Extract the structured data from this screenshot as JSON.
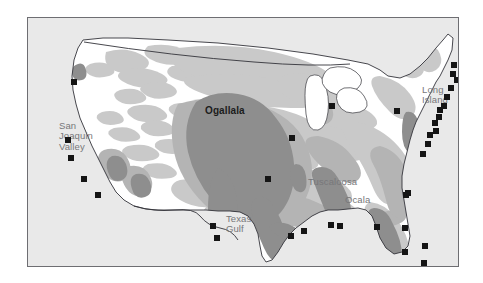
{
  "figure": {
    "kind": "thematic-map",
    "region": "United States",
    "background_color": "#ffffff",
    "frame": {
      "x": 27,
      "y": 17,
      "width": 432,
      "height": 250,
      "border_color": "#6e6e72",
      "fill_color": "#e9e9e9"
    }
  },
  "legend_colors": {
    "land_fill": "#ffffff",
    "light_shading": "#c9c9c9",
    "medium_shading": "#b4b4b4",
    "dark_shading": "#8e8e8e",
    "outline": "#33333a",
    "marker": "#151515",
    "label_gray": "#77777a",
    "label_dark": "#1c1c1c"
  },
  "labels": [
    {
      "id": "san-joaquin-valley",
      "text": "San\nJoaquin\nValley",
      "x": 58,
      "y": 120,
      "style": "gray"
    },
    {
      "id": "ogallala",
      "text": "Ogallala",
      "x": 204,
      "y": 105,
      "style": "dark"
    },
    {
      "id": "tuscaloosa",
      "text": "Tuscaloosa",
      "x": 307,
      "y": 176,
      "style": "gray"
    },
    {
      "id": "ocala",
      "text": "Ocala",
      "x": 344,
      "y": 194,
      "style": "gray"
    },
    {
      "id": "texas-gulf",
      "text": "Texas\nGulf",
      "x": 225,
      "y": 213,
      "style": "gray"
    },
    {
      "id": "long-island",
      "text": "Long\nIsland",
      "x": 421,
      "y": 84,
      "style": "gray"
    }
  ],
  "markers": [
    {
      "id": "marker-pacific-nw",
      "x": 46,
      "y": 64
    },
    {
      "id": "marker-san-joaquin-n",
      "x": 40,
      "y": 122
    },
    {
      "id": "marker-san-joaquin-s",
      "x": 43,
      "y": 140
    },
    {
      "id": "marker-central-coast",
      "x": 56,
      "y": 161
    },
    {
      "id": "marker-socal",
      "x": 70,
      "y": 177
    },
    {
      "id": "marker-west-tx-n",
      "x": 185,
      "y": 208
    },
    {
      "id": "marker-west-tx-s",
      "x": 189,
      "y": 220
    },
    {
      "id": "marker-ogallala-e",
      "x": 264,
      "y": 120
    },
    {
      "id": "marker-central-plains",
      "x": 240,
      "y": 161
    },
    {
      "id": "marker-lake-michigan",
      "x": 304,
      "y": 88
    },
    {
      "id": "marker-ohio-valley",
      "x": 369,
      "y": 93
    },
    {
      "id": "marker-texas-gulf-coast",
      "x": 263,
      "y": 218
    },
    {
      "id": "marker-gulf-coast-la",
      "x": 276,
      "y": 213
    },
    {
      "id": "marker-gulf-coast-ms",
      "x": 303,
      "y": 207
    },
    {
      "id": "marker-gulf-coast-al",
      "x": 312,
      "y": 208
    },
    {
      "id": "marker-ocala-fl",
      "x": 349,
      "y": 209
    },
    {
      "id": "marker-fl-north",
      "x": 378,
      "y": 177
    },
    {
      "id": "marker-fl-central",
      "x": 377,
      "y": 210
    },
    {
      "id": "marker-fl-west",
      "x": 377,
      "y": 234
    },
    {
      "id": "marker-fl-south",
      "x": 397,
      "y": 228
    },
    {
      "id": "marker-fl-keys",
      "x": 396,
      "y": 245
    },
    {
      "id": "marker-se-coast",
      "x": 380,
      "y": 175
    },
    {
      "id": "marker-carolina-1",
      "x": 395,
      "y": 136
    },
    {
      "id": "marker-carolina-2",
      "x": 400,
      "y": 126
    },
    {
      "id": "marker-chesapeake",
      "x": 402,
      "y": 117
    },
    {
      "id": "marker-delmarva",
      "x": 408,
      "y": 113
    },
    {
      "id": "marker-nj",
      "x": 407,
      "y": 105
    },
    {
      "id": "marker-ny-harbor",
      "x": 411,
      "y": 99
    },
    {
      "id": "marker-long-island-w",
      "x": 412,
      "y": 92
    },
    {
      "id": "marker-long-island-e",
      "x": 416,
      "y": 88
    },
    {
      "id": "marker-ct",
      "x": 419,
      "y": 79
    },
    {
      "id": "marker-ri",
      "x": 423,
      "y": 70
    },
    {
      "id": "marker-cape-cod",
      "x": 429,
      "y": 62
    },
    {
      "id": "marker-ma-north",
      "x": 425,
      "y": 56
    },
    {
      "id": "marker-nh",
      "x": 426,
      "y": 47
    },
    {
      "id": "marker-me-coast",
      "x": 434,
      "y": 38
    }
  ]
}
